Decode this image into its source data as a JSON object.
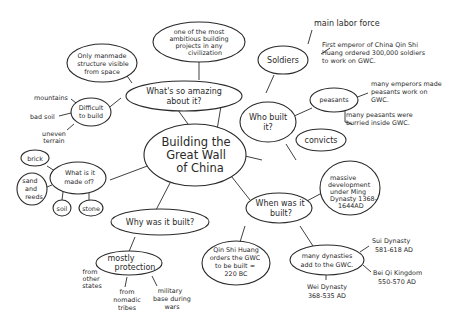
{
  "diagram": {
    "type": "mind-map",
    "central": {
      "lines": [
        "Building the",
        "Great Wall",
        "of China"
      ]
    },
    "branches": [
      {
        "id": "amazing",
        "lines": [
          "What's so amazing",
          "about it?"
        ],
        "children": [
          {
            "lines": [
              "one of the most",
              "ambitious building",
              "projects in any",
              "civilization"
            ]
          },
          {
            "lines": [
              "Only manmade",
              "structure visible",
              "from space"
            ]
          },
          {
            "lines": [
              "Difficult",
              "to build"
            ],
            "children": [
              {
                "lines": [
                  "mountains"
                ]
              },
              {
                "lines": [
                  "bad soil"
                ]
              },
              {
                "lines": [
                  "uneven",
                  "terrain"
                ]
              }
            ]
          }
        ]
      },
      {
        "id": "who",
        "lines": [
          "Who built",
          "it?"
        ],
        "children": [
          {
            "lines": [
              "Soldiers"
            ],
            "children": [
              {
                "lines": [
                  "main labor force"
                ]
              },
              {
                "lines": [
                  "First emperor of China Qin Shi",
                  "Huang ordered 300,000 soldiers",
                  "to work on GWC."
                ]
              }
            ]
          },
          {
            "lines": [
              "peasants"
            ],
            "children": [
              {
                "lines": [
                  "many emperors made",
                  "peasants work on",
                  "GWC."
                ]
              },
              {
                "lines": [
                  "many peasants were",
                  "burried inside GWC."
                ]
              }
            ]
          },
          {
            "lines": [
              "convicts"
            ]
          }
        ]
      },
      {
        "id": "made",
        "lines": [
          "What is it",
          "made of?"
        ],
        "children": [
          {
            "lines": [
              "brick"
            ]
          },
          {
            "lines": [
              "sand",
              "and",
              "reeds"
            ]
          },
          {
            "lines": [
              "soil"
            ]
          },
          {
            "lines": [
              "stone"
            ]
          }
        ]
      },
      {
        "id": "why",
        "lines": [
          "Why was it built?"
        ],
        "children": [
          {
            "lines": [
              "mostly",
              "protection"
            ],
            "children": [
              {
                "lines": [
                  "from",
                  "other",
                  "states"
                ]
              },
              {
                "lines": [
                  "from",
                  "nomadic",
                  "tribes"
                ]
              },
              {
                "lines": [
                  "military",
                  "base during",
                  "wars"
                ]
              }
            ]
          }
        ]
      },
      {
        "id": "when",
        "lines": [
          "When was it",
          "built?"
        ],
        "children": [
          {
            "lines": [
              "massive",
              "development",
              "under Ming",
              "Dynasty 1368-",
              "1644AD"
            ]
          },
          {
            "lines": [
              "Qin Shi Huang",
              "orders the GWC",
              "to be built ≈",
              "220 BC"
            ]
          },
          {
            "lines": [
              "many dynasties",
              "add to the GWC."
            ],
            "children": [
              {
                "lines": [
                  "Sui Dynasty",
                  "581-618 AD"
                ]
              },
              {
                "lines": [
                  "Bei Qi Kingdom",
                  "550-570 AD"
                ]
              },
              {
                "lines": [
                  "Wei Dynasty",
                  "368-535 AD"
                ]
              }
            ]
          }
        ]
      }
    ]
  }
}
